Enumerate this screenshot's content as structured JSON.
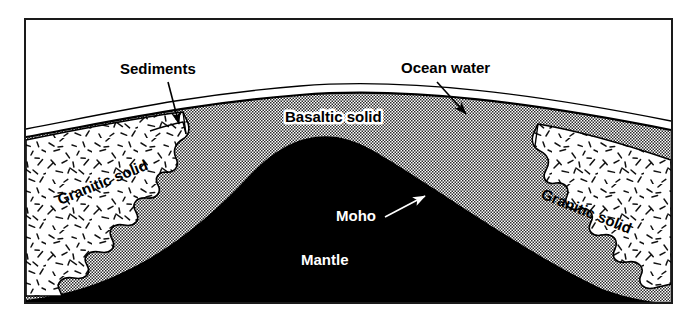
{
  "figure": {
    "kind": "geologic-cross-section",
    "background": "#ffffff",
    "frame": {
      "x": 25,
      "y": 19,
      "width": 647,
      "height": 284,
      "stroke": "#1a1a1a",
      "stroke_width": 2
    },
    "colors": {
      "ocean_water": "#ffffff",
      "basaltic_stipple_gray": "#b9b9b9",
      "mantle_black": "#000000",
      "granitic_white": "#ffffff",
      "line": "#000000",
      "label_dark": "#000000",
      "label_light": "#ffffff"
    },
    "labels": [
      {
        "id": "sediments",
        "text": "Sediments",
        "x": 120,
        "y": 74,
        "color": "#000000",
        "rotate": 0,
        "size": 15,
        "halo": false,
        "leader": {
          "from_x": 168,
          "from_y": 82,
          "to_x": 179,
          "to_y": 124,
          "arrow": true,
          "color": "#000000"
        }
      },
      {
        "id": "ocean-water",
        "text": "Ocean water",
        "x": 401,
        "y": 73,
        "color": "#000000",
        "rotate": 0,
        "size": 15,
        "halo": false,
        "leader": {
          "from_x": 437,
          "from_y": 82,
          "to_x": 466,
          "to_y": 114,
          "arrow": true,
          "color": "#000000"
        }
      },
      {
        "id": "basaltic-solid",
        "text": "Basaltic solid",
        "x": 285,
        "y": 122,
        "color": "#000000",
        "rotate": 0,
        "size": 15,
        "halo": true,
        "leader": null
      },
      {
        "id": "granitic-solid-left",
        "text": "Granitic solid",
        "x": 60,
        "y": 205,
        "color": "#000000",
        "rotate": -22,
        "size": 15,
        "halo": false,
        "leader": null
      },
      {
        "id": "granitic-solid-right",
        "text": "Granitic solid",
        "x": 540,
        "y": 198,
        "color": "#000000",
        "rotate": 22,
        "size": 15,
        "halo": false,
        "leader": null
      },
      {
        "id": "moho",
        "text": "Moho",
        "x": 336,
        "y": 221,
        "color": "#ffffff",
        "rotate": 0,
        "size": 15,
        "halo": false,
        "leader": {
          "from_x": 385,
          "from_y": 217,
          "to_x": 425,
          "to_y": 196,
          "arrow": true,
          "color": "#ffffff"
        }
      },
      {
        "id": "mantle",
        "text": "Mantle",
        "x": 301,
        "y": 265,
        "color": "#ffffff",
        "rotate": 0,
        "size": 15,
        "halo": false,
        "leader": null
      }
    ],
    "layers": [
      {
        "id": "ocean-water-layer",
        "name": "Ocean water",
        "fill": "#ffffff"
      },
      {
        "id": "basaltic-layer",
        "name": "Basaltic solid",
        "fill": "halftone-gray"
      },
      {
        "id": "mantle-layer",
        "name": "Mantle",
        "fill": "#000000"
      },
      {
        "id": "granitic-wedge-left",
        "name": "Granitic solid",
        "fill": "granite-dashes"
      },
      {
        "id": "granitic-wedge-right",
        "name": "Granitic solid",
        "fill": "granite-dashes"
      }
    ]
  }
}
